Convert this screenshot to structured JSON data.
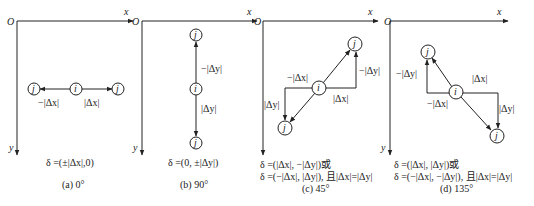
{
  "axes": {
    "origin": "O",
    "x_label": "x",
    "y_label": "y"
  },
  "node_labels": {
    "center": "i",
    "neighbor": "j"
  },
  "panels": [
    {
      "id": "a",
      "caption": "(a) 0°",
      "formula_lines": [
        "δ =(±|Δx|,0)"
      ],
      "edge_labels": [
        "−|Δx|",
        "|Δx|"
      ]
    },
    {
      "id": "b",
      "caption": "(b) 90°",
      "formula_lines": [
        "δ =(0, ±|Δy|)"
      ],
      "edge_labels": [
        "−|Δy|",
        "|Δy|"
      ]
    },
    {
      "id": "c",
      "caption": "(c) 45°",
      "formula_lines": [
        "δ =(|Δx|, −|Δy|)或",
        "δ =(−|Δx|, |Δy|), 且|Δx|=|Δy|"
      ],
      "edge_labels": [
        "−|Δx|",
        "−|Δy|",
        "|Δy|",
        "|Δx|"
      ]
    },
    {
      "id": "d",
      "caption": "(d) 135°",
      "formula_lines": [
        "δ =(|Δx|, |Δy|)或",
        "δ =(−|Δx|, −|Δy|), 且|Δx|=|Δy|"
      ],
      "edge_labels": [
        "−|Δy|",
        "|Δx|",
        "−|Δx|",
        "|Δy|"
      ]
    }
  ]
}
